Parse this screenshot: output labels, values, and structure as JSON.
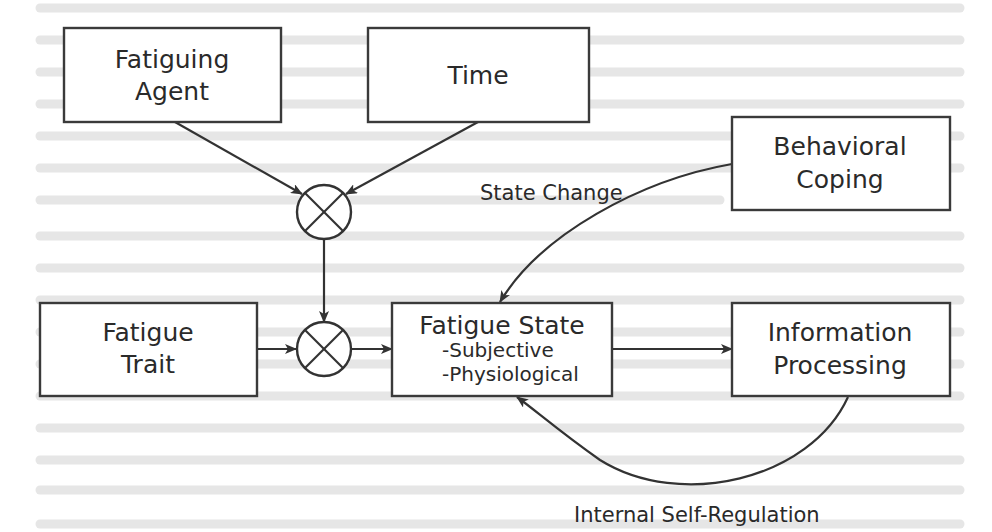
{
  "diagram": {
    "colors": {
      "stroke": "#333333",
      "text": "#2a2a2a",
      "background": "#ffffff",
      "faded_background_text": "#e6e6e6"
    },
    "nodes": {
      "fatiguing_agent": {
        "line1": "Fatiguing",
        "line2": "Agent"
      },
      "time": {
        "label": "Time"
      },
      "behavioral_coping": {
        "line1": "Behavioral",
        "line2": "Coping"
      },
      "fatigue_trait": {
        "line1": "Fatigue",
        "line2": "Trait"
      },
      "fatigue_state": {
        "title": "Fatigue State",
        "items": [
          "-Subjective",
          "-Physiological"
        ]
      },
      "information_processing": {
        "line1": "Information",
        "line2": "Processing"
      },
      "multiply_node_top": {
        "symbol": "⊗"
      },
      "multiply_node_bottom": {
        "symbol": "⊗"
      }
    },
    "edge_labels": {
      "state_change": "State Change",
      "internal_self_regulation": "Internal Self-Regulation"
    },
    "edges": [
      {
        "from": "Fatiguing Agent",
        "to": "multiply_node_top"
      },
      {
        "from": "Time",
        "to": "multiply_node_top"
      },
      {
        "from": "multiply_node_top",
        "to": "multiply_node_bottom"
      },
      {
        "from": "Fatigue Trait",
        "to": "multiply_node_bottom"
      },
      {
        "from": "multiply_node_bottom",
        "to": "Fatigue State"
      },
      {
        "from": "Behavioral Coping",
        "to": "Fatigue State",
        "label": "State Change"
      },
      {
        "from": "Fatigue State",
        "to": "Information Processing"
      },
      {
        "from": "Information Processing",
        "to": "Fatigue State",
        "label": "Internal Self-Regulation"
      }
    ]
  }
}
